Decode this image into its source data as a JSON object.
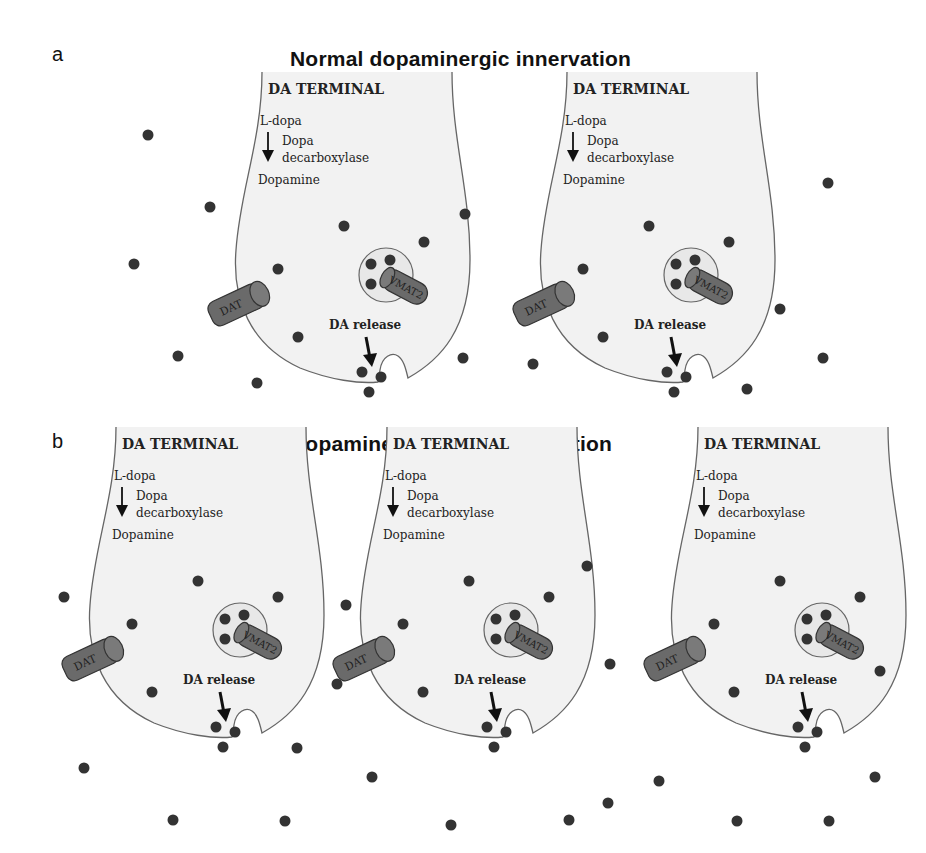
{
  "panels": [
    {
      "letter": "a",
      "title": "Normal dopaminergic innervation",
      "terminal_offsets_x": [
        0,
        305
      ],
      "terminal_offset_y": 0
    },
    {
      "letter": "b",
      "title": "Dopaminergic hyperinnervation",
      "terminal_offsets_x": [
        -146,
        125,
        436
      ],
      "terminal_offset_y": 355
    }
  ],
  "terminal": {
    "header": "DA TERMINAL",
    "substrate": "L-dopa",
    "enzyme_line1": "Dopa",
    "enzyme_line2": "decarboxylase",
    "product": "Dopamine",
    "transporter_label": "DAT",
    "vesicle_transporter_label": "VMAT2",
    "release_label": "DA release"
  },
  "colors": {
    "terminal_fill": "#f2f2f2",
    "terminal_stroke": "#666666",
    "dopamine_dot": "#333333",
    "transporter_fill": "#6a6a6a",
    "transporter_text": "#f0f0f0"
  },
  "extracellular_dots_a": [
    [
      148,
      135
    ],
    [
      210,
      207
    ],
    [
      134,
      264
    ],
    [
      465,
      214
    ],
    [
      178,
      356
    ],
    [
      257,
      383
    ],
    [
      463,
      358
    ],
    [
      828,
      183
    ],
    [
      780,
      309
    ],
    [
      823,
      358
    ],
    [
      747,
      389
    ],
    [
      533,
      364
    ]
  ],
  "extracellular_dots_b": [
    [
      64,
      597
    ],
    [
      84,
      768
    ],
    [
      173,
      820
    ],
    [
      285,
      821
    ],
    [
      297,
      748
    ],
    [
      346,
      605
    ],
    [
      337,
      684
    ],
    [
      372,
      777
    ],
    [
      451,
      825
    ],
    [
      587,
      566
    ],
    [
      608,
      803
    ],
    [
      569,
      820
    ],
    [
      610,
      664
    ],
    [
      659,
      781
    ],
    [
      737,
      821
    ],
    [
      829,
      821
    ],
    [
      875,
      777
    ],
    [
      880,
      671
    ]
  ]
}
